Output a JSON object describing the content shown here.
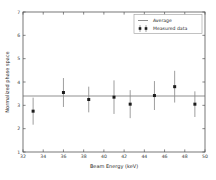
{
  "chart_data": {
    "type": "scatter",
    "title": "",
    "xlabel": "Beam Energy (keV)",
    "ylabel": "Normalized phase space",
    "xlim": [
      32,
      50
    ],
    "ylim": [
      1,
      7
    ],
    "xticks": [
      32,
      34,
      36,
      38,
      40,
      42,
      44,
      46,
      48,
      50
    ],
    "xtick_labels": [
      "32",
      "34",
      "36",
      "38",
      "40",
      "42",
      "44",
      "46",
      "48",
      "50"
    ],
    "yticks": [
      1,
      2,
      3,
      4,
      5,
      6,
      7
    ],
    "ytick_labels": [
      "1",
      "2",
      "3",
      "4",
      "5",
      "6",
      "7"
    ],
    "grid": false,
    "legend_position": "upper right",
    "legend": [
      {
        "label": "Average",
        "marker": "line",
        "color": "#6b6b6b"
      },
      {
        "label": "Measured data",
        "marker": "errorbar-point",
        "color": "#1c1c1c"
      }
    ],
    "series": [
      {
        "name": "Average",
        "type": "hline",
        "value": 3.4,
        "color": "#6b6b6b"
      },
      {
        "name": "Measured data",
        "type": "scatter-errorbar",
        "color": "#1c1c1c",
        "x": [
          33.0,
          36.0,
          38.5,
          41.0,
          42.6,
          45.0,
          47.0,
          49.0
        ],
        "y": [
          2.75,
          3.55,
          3.25,
          3.35,
          3.05,
          3.42,
          3.8,
          3.05
        ],
        "yerr": [
          0.58,
          0.62,
          0.55,
          0.72,
          0.6,
          0.62,
          0.68,
          0.55
        ]
      }
    ]
  }
}
